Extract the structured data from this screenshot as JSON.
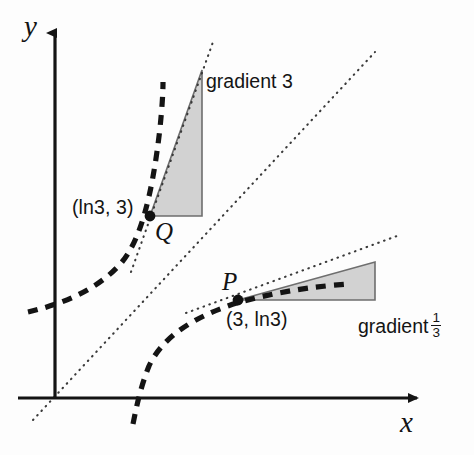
{
  "figure": {
    "kind": "math-diagram",
    "background_color": "#fdfdfd",
    "ink_color": "#141414",
    "triangle_fill_color": "#d2d2d2",
    "triangle_edge_color": "#6e6e6e"
  },
  "axes": {
    "y_label": "y",
    "x_label": "x",
    "origin": {
      "x": 55,
      "y": 398
    },
    "y_axis_top": 25,
    "x_axis_right": 425,
    "axis_color": "#141414"
  },
  "points": [
    {
      "name": "Q",
      "label": "Q",
      "coordinate_text": "(ln3, 3)",
      "px": {
        "x": 150,
        "y": 216
      },
      "on_curve": "exponential"
    },
    {
      "name": "P",
      "label": "P",
      "coordinate_text": "(3, ln3)",
      "px": {
        "x": 238,
        "y": 300
      },
      "on_curve": "logarithm"
    }
  ],
  "gradient_triangles": [
    {
      "name": "upper-gradient-triangle",
      "at_point": "Q",
      "label_text": "gradient 3",
      "gradient_value": "3",
      "has_fraction": false,
      "vertices_px": [
        {
          "x": 150,
          "y": 216
        },
        {
          "x": 202,
          "y": 70
        },
        {
          "x": 202,
          "y": 216
        }
      ]
    },
    {
      "name": "lower-gradient-triangle",
      "at_point": "P",
      "label_text": "gradient",
      "gradient_numerator": "1",
      "gradient_denominator": "3",
      "has_fraction": true,
      "vertices_px": [
        {
          "x": 238,
          "y": 300
        },
        {
          "x": 375,
          "y": 262
        },
        {
          "x": 375,
          "y": 300
        }
      ]
    }
  ],
  "curves": [
    {
      "name": "exponential-curve",
      "style": "thick-dashed",
      "path": "M 28,312 C 62,304 98,290 122,262 C 140,240 152,198 160,128 C 162,108 163,94 163,82"
    },
    {
      "name": "logarithm-curve",
      "style": "thick-dashed",
      "path": "M 133,424 C 137,404 141,386 149,366 C 163,336 195,316 240,302 C 285,290 320,286 348,284"
    },
    {
      "name": "line-y-equals-x",
      "style": "fine-dotted",
      "path": "M 33,420 L 375,52"
    },
    {
      "name": "tangent-at-Q",
      "style": "fine-dotted",
      "path": "M 131,272 L 213,42"
    },
    {
      "name": "tangent-at-P",
      "style": "fine-dotted",
      "path": "M 186,313 L 397,236"
    }
  ]
}
